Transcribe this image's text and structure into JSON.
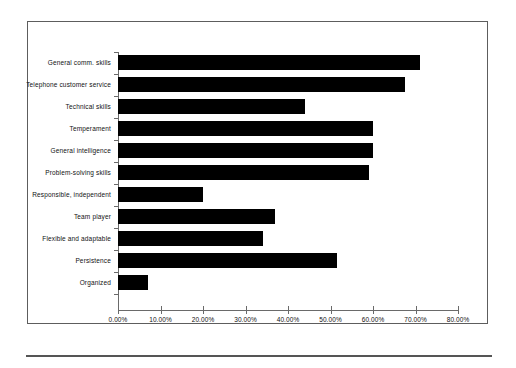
{
  "chart_data": {
    "type": "bar",
    "orientation": "horizontal",
    "title": "",
    "subtitle": "",
    "xlabel": "",
    "ylabel": "",
    "xlim": [
      0,
      80
    ],
    "grid": false,
    "legend": false,
    "legend_position": "none",
    "bar_color": "#000000",
    "axis_color": "#6a6a6a",
    "frame_color": "#5d5d5d",
    "categories": [
      "General comm. skills",
      "Telephone customer service",
      "Technical skills",
      "Temperament",
      "General intelligence",
      "Problem-solving skills",
      "Responsible, independent",
      "Team player",
      "Flexible and adaptable",
      "Persistence",
      "Organized"
    ],
    "values": [
      71.0,
      67.5,
      44.0,
      60.0,
      60.0,
      59.0,
      20.0,
      37.0,
      34.0,
      51.5,
      7.0
    ],
    "tick_values": [
      0,
      10,
      20,
      30,
      40,
      50,
      60,
      70,
      80
    ],
    "tick_labels": [
      "0.00%",
      "10.00%",
      "20.00%",
      "30.00%",
      "40.00%",
      "50.00%",
      "60.00%",
      "70.00%",
      "80.00%"
    ]
  }
}
